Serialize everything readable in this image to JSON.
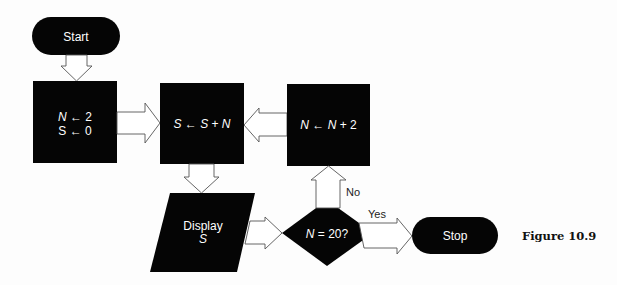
{
  "diagram": {
    "type": "flowchart",
    "colors": {
      "node_fill": "#050505",
      "node_text": "#ffffff",
      "arrow_outline": "#555555",
      "background": "#fdfdfd"
    },
    "nodes": {
      "start": {
        "shape": "terminator",
        "label": "Start"
      },
      "init": {
        "shape": "process",
        "line1_var": "N",
        "line1_rest": " ← 2",
        "line2": "S ← 0"
      },
      "accumulate": {
        "shape": "process",
        "label_parts": [
          "S",
          " ← ",
          "S",
          " + ",
          "N"
        ]
      },
      "increment": {
        "shape": "process",
        "label_parts": [
          "N",
          " ← ",
          "N",
          " + 2"
        ]
      },
      "display": {
        "shape": "input-output",
        "line1": "Display",
        "line2": "S"
      },
      "decision": {
        "shape": "decision",
        "label_var": "N",
        "label_rest": " = 20?"
      },
      "stop": {
        "shape": "terminator",
        "label": "Stop"
      }
    },
    "edges": [
      {
        "from": "start",
        "to": "init"
      },
      {
        "from": "init",
        "to": "accumulate"
      },
      {
        "from": "accumulate",
        "to": "display"
      },
      {
        "from": "display",
        "to": "decision"
      },
      {
        "from": "decision",
        "to": "increment",
        "label": "No"
      },
      {
        "from": "decision",
        "to": "stop",
        "label": "Yes"
      },
      {
        "from": "increment",
        "to": "accumulate"
      }
    ],
    "caption": "Figure 10.9"
  }
}
